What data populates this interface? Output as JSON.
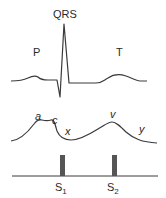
{
  "ecg": {
    "labels": {
      "qrs": "QRS",
      "p": "P",
      "t": "T"
    }
  },
  "jvp": {
    "labels": {
      "a": "a",
      "c": "c",
      "x": "x",
      "v": "v",
      "y": "y"
    }
  },
  "heart_sounds": {
    "s1": {
      "base": "S",
      "sub": "1"
    },
    "s2": {
      "base": "S",
      "sub": "2"
    }
  },
  "colors": {
    "trace": "#3a3a3a",
    "bar": "#555555",
    "text": "#2a2a2a"
  }
}
